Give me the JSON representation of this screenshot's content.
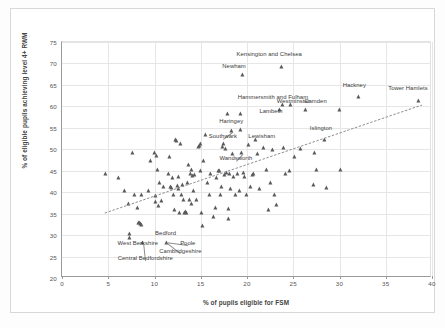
{
  "chart_data": {
    "type": "scatter",
    "title": "",
    "xlabel": "% of pupils eligible for FSM",
    "ylabel": "% of eligible pupils achieving level 4+ RWM",
    "xlim": [
      0,
      40
    ],
    "ylim": [
      20,
      75
    ],
    "xticks": [
      0,
      5,
      10,
      15,
      20,
      25,
      30,
      35,
      40
    ],
    "yticks": [
      20,
      25,
      30,
      35,
      40,
      45,
      50,
      55,
      60,
      65,
      70,
      75
    ],
    "grid": true,
    "legend": "none",
    "marker": "triangle",
    "marker_color": "#5a5a5e",
    "trendline": {
      "visible": true,
      "style": "dotted",
      "color": "#8d8d8d",
      "x_start": 4.6,
      "y_start": 34.8,
      "x_end": 39.2,
      "y_end": 60.2
    },
    "points": [
      {
        "x": 4.8,
        "y": 44.0
      },
      {
        "x": 6.2,
        "y": 43.0
      },
      {
        "x": 6.8,
        "y": 40.0
      },
      {
        "x": 7.2,
        "y": 37.0
      },
      {
        "x": 7.4,
        "y": 30.0
      },
      {
        "x": 7.4,
        "y": 29.2
      },
      {
        "x": 7.7,
        "y": 49.0
      },
      {
        "x": 7.9,
        "y": 39.0
      },
      {
        "x": 8.2,
        "y": 36.0
      },
      {
        "x": 8.3,
        "y": 32.5
      },
      {
        "x": 8.4,
        "y": 32.6
      },
      {
        "x": 8.5,
        "y": 32.4
      },
      {
        "x": 8.6,
        "y": 32.1
      },
      {
        "x": 8.7,
        "y": 39.0
      },
      {
        "x": 8.8,
        "y": 28.0
      },
      {
        "x": 9.4,
        "y": 40.0
      },
      {
        "x": 9.6,
        "y": 47.0
      },
      {
        "x": 10.1,
        "y": 49.0
      },
      {
        "x": 10.2,
        "y": 38.8
      },
      {
        "x": 10.2,
        "y": 37.5
      },
      {
        "x": 10.3,
        "y": 48.2
      },
      {
        "x": 10.4,
        "y": 45.0
      },
      {
        "x": 10.5,
        "y": 36.5
      },
      {
        "x": 10.6,
        "y": 42.0
      },
      {
        "x": 10.8,
        "y": 37.6
      },
      {
        "x": 11.0,
        "y": 41.0
      },
      {
        "x": 11.4,
        "y": 28.0
      },
      {
        "x": 11.6,
        "y": 44.0
      },
      {
        "x": 11.7,
        "y": 48.0
      },
      {
        "x": 11.8,
        "y": 41.0
      },
      {
        "x": 11.9,
        "y": 40.8
      },
      {
        "x": 12.0,
        "y": 43.0
      },
      {
        "x": 12.1,
        "y": 39.0
      },
      {
        "x": 12.2,
        "y": 35.6
      },
      {
        "x": 12.3,
        "y": 52.0
      },
      {
        "x": 12.4,
        "y": 51.8
      },
      {
        "x": 12.5,
        "y": 41.2
      },
      {
        "x": 12.6,
        "y": 40.5
      },
      {
        "x": 12.7,
        "y": 43.2
      },
      {
        "x": 12.8,
        "y": 35.0
      },
      {
        "x": 12.9,
        "y": 51.0
      },
      {
        "x": 13.0,
        "y": 39.2
      },
      {
        "x": 13.1,
        "y": 41.4
      },
      {
        "x": 13.2,
        "y": 38.0
      },
      {
        "x": 13.3,
        "y": 35.0
      },
      {
        "x": 13.4,
        "y": 35.1
      },
      {
        "x": 13.5,
        "y": 35.0
      },
      {
        "x": 13.6,
        "y": 42.0
      },
      {
        "x": 13.7,
        "y": 46.0
      },
      {
        "x": 13.8,
        "y": 38.0
      },
      {
        "x": 13.9,
        "y": 44.0
      },
      {
        "x": 14.0,
        "y": 45.0
      },
      {
        "x": 14.1,
        "y": 37.0
      },
      {
        "x": 14.2,
        "y": 43.5
      },
      {
        "x": 14.3,
        "y": 40.0
      },
      {
        "x": 14.4,
        "y": 43.8
      },
      {
        "x": 14.6,
        "y": 38.0
      },
      {
        "x": 14.8,
        "y": 50.4
      },
      {
        "x": 14.9,
        "y": 50.6
      },
      {
        "x": 15.0,
        "y": 51.0
      },
      {
        "x": 15.0,
        "y": 44.8
      },
      {
        "x": 15.1,
        "y": 35.0
      },
      {
        "x": 15.2,
        "y": 32.0
      },
      {
        "x": 15.4,
        "y": 47.0
      },
      {
        "x": 15.6,
        "y": 53.0
      },
      {
        "x": 15.8,
        "y": 42.0
      },
      {
        "x": 16.0,
        "y": 39.0
      },
      {
        "x": 16.1,
        "y": 44.0
      },
      {
        "x": 16.4,
        "y": 34.0
      },
      {
        "x": 16.6,
        "y": 36.0
      },
      {
        "x": 16.8,
        "y": 43.0
      },
      {
        "x": 17.0,
        "y": 44.8
      },
      {
        "x": 17.1,
        "y": 44.6
      },
      {
        "x": 17.2,
        "y": 39.0
      },
      {
        "x": 17.3,
        "y": 41.0
      },
      {
        "x": 17.4,
        "y": 50.2
      },
      {
        "x": 17.5,
        "y": 51.0
      },
      {
        "x": 17.6,
        "y": 43.8
      },
      {
        "x": 17.7,
        "y": 49.8
      },
      {
        "x": 17.8,
        "y": 44.2
      },
      {
        "x": 17.9,
        "y": 58.0
      },
      {
        "x": 18.0,
        "y": 33.6
      },
      {
        "x": 18.1,
        "y": 35.8
      },
      {
        "x": 18.2,
        "y": 44.0
      },
      {
        "x": 18.3,
        "y": 40.6
      },
      {
        "x": 18.4,
        "y": 54.0
      },
      {
        "x": 18.5,
        "y": 48.6
      },
      {
        "x": 18.6,
        "y": 43.4
      },
      {
        "x": 18.8,
        "y": 39.0
      },
      {
        "x": 19.0,
        "y": 44.0
      },
      {
        "x": 19.2,
        "y": 40.0
      },
      {
        "x": 19.3,
        "y": 54.2
      },
      {
        "x": 19.4,
        "y": 58.0
      },
      {
        "x": 19.5,
        "y": 48.8
      },
      {
        "x": 19.6,
        "y": 67.0
      },
      {
        "x": 19.7,
        "y": 44.2
      },
      {
        "x": 19.8,
        "y": 43.2
      },
      {
        "x": 20.0,
        "y": 39.0
      },
      {
        "x": 20.2,
        "y": 50.8
      },
      {
        "x": 20.4,
        "y": 41.0
      },
      {
        "x": 20.6,
        "y": 43.8
      },
      {
        "x": 20.8,
        "y": 44.0
      },
      {
        "x": 21.0,
        "y": 52.0
      },
      {
        "x": 21.2,
        "y": 48.6
      },
      {
        "x": 21.4,
        "y": 40.6
      },
      {
        "x": 21.8,
        "y": 50.0
      },
      {
        "x": 22.2,
        "y": 45.0
      },
      {
        "x": 22.4,
        "y": 35.6
      },
      {
        "x": 22.6,
        "y": 42.0
      },
      {
        "x": 22.8,
        "y": 49.6
      },
      {
        "x": 23.0,
        "y": 39.0
      },
      {
        "x": 23.2,
        "y": 36.8
      },
      {
        "x": 23.6,
        "y": 59.0
      },
      {
        "x": 23.8,
        "y": 69.0
      },
      {
        "x": 23.9,
        "y": 60.0
      },
      {
        "x": 24.0,
        "y": 50.0
      },
      {
        "x": 24.2,
        "y": 44.0
      },
      {
        "x": 24.6,
        "y": 44.8
      },
      {
        "x": 24.8,
        "y": 60.0
      },
      {
        "x": 25.2,
        "y": 48.0
      },
      {
        "x": 25.8,
        "y": 49.8
      },
      {
        "x": 26.4,
        "y": 59.0
      },
      {
        "x": 27.2,
        "y": 41.4
      },
      {
        "x": 27.4,
        "y": 48.8
      },
      {
        "x": 27.6,
        "y": 45.0
      },
      {
        "x": 28.4,
        "y": 52.0
      },
      {
        "x": 28.6,
        "y": 40.8
      },
      {
        "x": 30.0,
        "y": 59.0
      },
      {
        "x": 30.2,
        "y": 45.0
      },
      {
        "x": 32.1,
        "y": 62.0
      },
      {
        "x": 38.6,
        "y": 61.0
      }
    ],
    "annotations": [
      {
        "label": "Kensington and Chelsea",
        "x": 23.8,
        "y": 69.0,
        "label_x": 22.4,
        "label_y": 71.6,
        "leader": false
      },
      {
        "label": "Newham",
        "x": 19.6,
        "y": 67.0,
        "label_x": 18.6,
        "label_y": 68.6,
        "leader": false
      },
      {
        "label": "Hackney",
        "x": 32.1,
        "y": 62.0,
        "label_x": 31.6,
        "label_y": 64.2,
        "leader": false
      },
      {
        "label": "Tower Hamlets",
        "x": 38.6,
        "y": 61.0,
        "label_x": 37.4,
        "label_y": 63.6,
        "leader": false
      },
      {
        "label": "Hammersmith and Fulham",
        "x": 23.6,
        "y": 59.0,
        "label_x": 22.8,
        "label_y": 61.4,
        "leader": false
      },
      {
        "label": "Westminster",
        "x": 24.8,
        "y": 60.0,
        "label_x": 25.0,
        "label_y": 60.6,
        "leader": false
      },
      {
        "label": "Camden",
        "x": 26.4,
        "y": 59.0,
        "label_x": 27.4,
        "label_y": 60.6,
        "leader": false
      },
      {
        "label": "Lambeth",
        "x": 23.6,
        "y": 59.0,
        "label_x": 22.6,
        "label_y": 58.2,
        "leader": false
      },
      {
        "label": "Haringey",
        "x": 19.3,
        "y": 54.2,
        "label_x": 18.3,
        "label_y": 56.0,
        "leader": false
      },
      {
        "label": "Southwark",
        "x": 18.4,
        "y": 54.0,
        "label_x": 17.4,
        "label_y": 52.4,
        "leader": true
      },
      {
        "label": "Lewisham",
        "x": 21.0,
        "y": 52.0,
        "label_x": 21.6,
        "label_y": 52.4,
        "leader": false
      },
      {
        "label": "Islington",
        "x": 28.4,
        "y": 52.0,
        "label_x": 28.0,
        "label_y": 54.2,
        "leader": false
      },
      {
        "label": "Wandsworth",
        "x": 19.5,
        "y": 48.8,
        "label_x": 18.8,
        "label_y": 47.2,
        "leader": true
      },
      {
        "label": "Bedford",
        "x": 11.4,
        "y": 28.0,
        "label_x": 11.2,
        "label_y": 29.8,
        "leader": false
      },
      {
        "label": "West Berkshire",
        "x": 8.8,
        "y": 28.0,
        "label_x": 8.2,
        "label_y": 27.4,
        "leader": false
      },
      {
        "label": "Poole",
        "x": 11.4,
        "y": 28.0,
        "label_x": 13.6,
        "label_y": 27.4,
        "leader": true
      },
      {
        "label": "Cambridgeshire",
        "x": 11.4,
        "y": 28.0,
        "label_x": 12.8,
        "label_y": 25.6,
        "leader": true
      },
      {
        "label": "Central Bedfordshire",
        "x": 8.8,
        "y": 28.0,
        "label_x": 9.0,
        "label_y": 24.0,
        "leader": true
      }
    ]
  }
}
